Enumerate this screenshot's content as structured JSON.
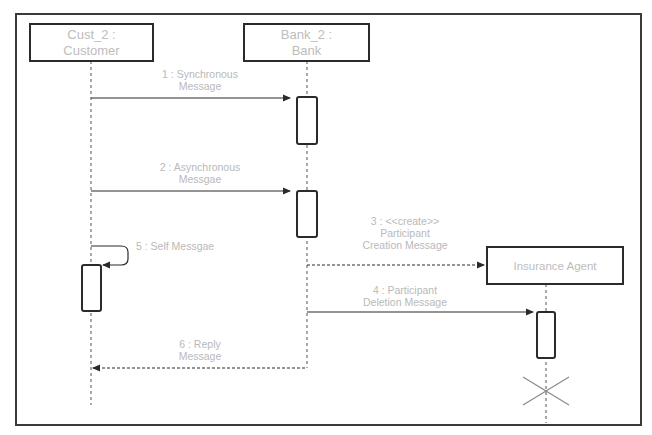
{
  "diagram": {
    "type": "UML sequence diagram",
    "participants": [
      {
        "id": "cust",
        "line1": "Cust_2 :",
        "line2": "Customer"
      },
      {
        "id": "bank",
        "line1": "Bank_2 :",
        "line2": "Bank"
      },
      {
        "id": "agent",
        "label": "Insurance Agent"
      }
    ],
    "messages": [
      {
        "id": "m1",
        "line1": "1 : Synchronous",
        "line2": "Message",
        "from": "Cust_2 : Customer",
        "to": "Bank_2 : Bank",
        "style": "solid"
      },
      {
        "id": "m2",
        "line1": "2 : Asynchronous",
        "line2": "Messgae",
        "from": "Cust_2 : Customer",
        "to": "Bank_2 : Bank",
        "style": "solid"
      },
      {
        "id": "m3",
        "line1": "3 : <<create>>",
        "line2": "Participant",
        "line3": "Creation Message",
        "from": "Bank_2 : Bank",
        "to": "Insurance Agent",
        "style": "dashed"
      },
      {
        "id": "m4",
        "line1": "4 : Participant",
        "line2": "Deletion Message",
        "from": "Bank_2 : Bank",
        "to": "Insurance Agent",
        "style": "solid"
      },
      {
        "id": "m5",
        "line1": "5 : Self Messgae",
        "from": "Cust_2 : Customer",
        "to": "Cust_2 : Customer",
        "style": "solid"
      },
      {
        "id": "m6",
        "line1": "6 : Reply",
        "line2": "Message",
        "from": "Bank_2 : Bank",
        "to": "Cust_2 : Customer",
        "style": "dashed"
      }
    ],
    "colors": {
      "line": "#2b2b2b",
      "text": "#b9b9b9",
      "destroy": "#8a8a8a"
    }
  }
}
